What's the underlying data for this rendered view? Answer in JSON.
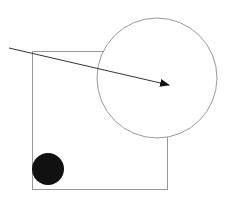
{
  "canvas": {
    "width": 232,
    "height": 204,
    "background": "#ffffff"
  },
  "shapes": {
    "rectangle": {
      "x": 32,
      "y": 51,
      "width": 135,
      "height": 138,
      "stroke": "#999999",
      "fill": "none"
    },
    "large_circle": {
      "cx": 157,
      "cy": 78,
      "r": 60,
      "stroke": "#999999",
      "fill": "#ffffff"
    },
    "small_circle": {
      "cx": 48,
      "cy": 169,
      "r": 16,
      "fill": "#111111"
    },
    "arrow": {
      "x1": 9,
      "y1": 48,
      "x2": 169,
      "y2": 85,
      "stroke": "#333333"
    }
  }
}
